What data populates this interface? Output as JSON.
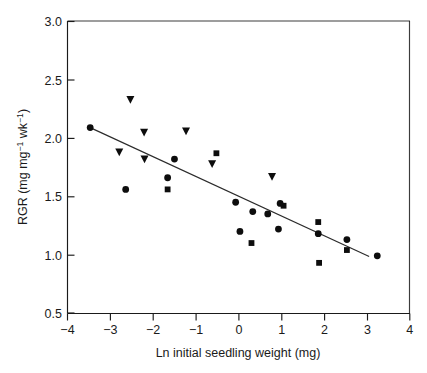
{
  "chart_data": {
    "type": "scatter",
    "title": "",
    "xlabel": "Ln initial seedling weight (mg)",
    "ylabel": "RGR (mg mg⁻¹ wk⁻¹)",
    "ylabel_parts": {
      "prefix": "RGR (mg mg",
      "sup1": "−1",
      "mid": " wk",
      "sup2": "−1",
      "suffix": ")"
    },
    "xlim": [
      -4,
      4
    ],
    "ylim": [
      0.5,
      3.0
    ],
    "xticks": [
      -4,
      -3,
      -2,
      -1,
      0,
      1,
      2,
      3,
      4
    ],
    "xticklabels": [
      "−4",
      "−3",
      "−2",
      "−1",
      "0",
      "1",
      "2",
      "3",
      "4"
    ],
    "yticks": [
      0.5,
      1.0,
      1.5,
      2.0,
      2.5,
      3.0
    ],
    "yticklabels": [
      "0.5",
      "1.0",
      "1.5",
      "2.0",
      "2.5",
      "3.0"
    ],
    "grid": false,
    "legend": null,
    "marker_color": "#0d0d0d",
    "line_color": "#2b2b2b",
    "series": [
      {
        "name": "circle",
        "marker": "circle",
        "points": [
          [
            -3.47,
            2.09
          ],
          [
            -2.64,
            1.56
          ],
          [
            -1.66,
            1.66
          ],
          [
            -1.5,
            1.82
          ],
          [
            -0.07,
            1.45
          ],
          [
            0.03,
            1.2
          ],
          [
            0.33,
            1.37
          ],
          [
            0.68,
            1.35
          ],
          [
            0.97,
            1.44
          ],
          [
            0.93,
            1.22
          ],
          [
            1.86,
            1.18
          ],
          [
            2.53,
            1.13
          ],
          [
            3.24,
            0.99
          ]
        ]
      },
      {
        "name": "triangle",
        "marker": "triangle-down",
        "points": [
          [
            -2.53,
            2.33
          ],
          [
            -2.79,
            1.88
          ],
          [
            -2.21,
            2.05
          ],
          [
            -2.2,
            1.82
          ],
          [
            -1.23,
            2.06
          ],
          [
            -0.62,
            1.78
          ],
          [
            0.78,
            1.67
          ]
        ]
      },
      {
        "name": "square",
        "marker": "square",
        "points": [
          [
            -1.66,
            1.56
          ],
          [
            -0.52,
            1.87
          ],
          [
            0.3,
            1.1
          ],
          [
            1.05,
            1.42
          ],
          [
            1.86,
            1.28
          ],
          [
            1.88,
            0.93
          ],
          [
            2.53,
            1.04
          ]
        ]
      }
    ],
    "fit_line": {
      "name": "regression-line",
      "x_start": -3.47,
      "y_start": 2.09,
      "x_end": 3.05,
      "y_end": 0.985
    }
  },
  "axes": {
    "frame": "left-and-bottom-spines"
  }
}
